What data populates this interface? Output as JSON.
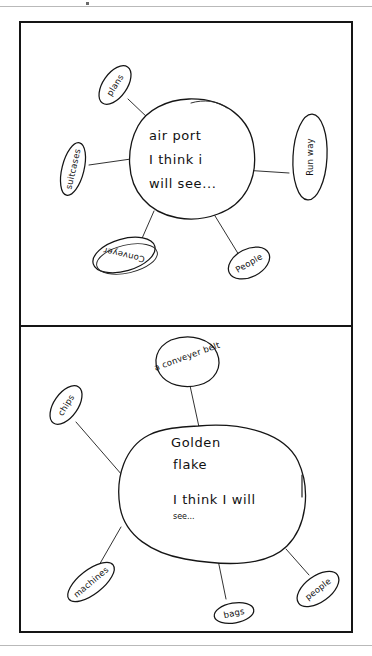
{
  "document": {
    "type": "scanned-handwritten-worksheet",
    "title": "Hand-drawn bubble maps",
    "ink_color": "#151515",
    "paper_color": "#ffffff",
    "rule_color": "#b9b9b9"
  },
  "panels": [
    {
      "id": "panel-top",
      "center": {
        "shape": "circle",
        "lines": [
          "air port",
          "I think i",
          "will see..."
        ]
      },
      "nodes": [
        {
          "id": "plans",
          "label": "plans",
          "position": "upper-left",
          "rotation": -60
        },
        {
          "id": "suitcases",
          "label": "suitcases",
          "position": "left",
          "rotation": -78
        },
        {
          "id": "runway",
          "label": "Run way",
          "position": "right",
          "rotation": -90
        },
        {
          "id": "conveyer",
          "label": "Conveyer",
          "position": "lower-left",
          "rotation": 183
        },
        {
          "id": "people",
          "label": "People",
          "position": "lower-right",
          "rotation": -28
        }
      ]
    },
    {
      "id": "panel-bottom",
      "center": {
        "shape": "blob",
        "lines": [
          "Golden",
          "flake"
        ],
        "sub_lines": [
          "I think I will",
          "see..."
        ]
      },
      "nodes": [
        {
          "id": "conveyer-belt",
          "label": "a conveyer belt",
          "position": "top",
          "rotation": -18
        },
        {
          "id": "chips",
          "label": "chips",
          "position": "upper-left",
          "rotation": -58
        },
        {
          "id": "machines",
          "label": "machines",
          "position": "lower-left",
          "rotation": -38
        },
        {
          "id": "bags",
          "label": "bags",
          "position": "bottom",
          "rotation": -12
        },
        {
          "id": "people",
          "label": "people",
          "position": "lower-right",
          "rotation": -36
        }
      ]
    }
  ]
}
